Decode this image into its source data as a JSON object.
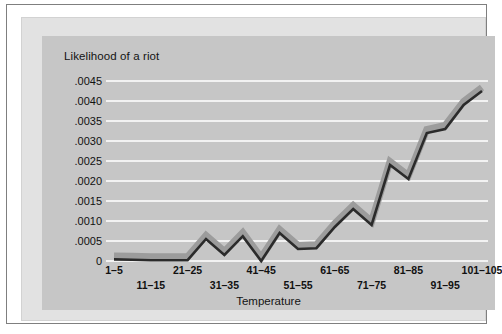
{
  "figure": {
    "background_color": "#ffffff",
    "frame_color": "#7f7f7f",
    "plot_background_color": "#c6c6c6",
    "gridline_color": "#f2f2f2",
    "series_line_color": "#2b2b2b",
    "series_shadow_color": "#9c9c9c"
  },
  "chart_data": {
    "type": "line",
    "title": "Likelihood of a riot",
    "xlabel": "Temperature",
    "ylabel": "Likelihood of a riot",
    "grid": true,
    "legend": "none",
    "xlim": [
      0,
      20
    ],
    "ylim": [
      0,
      0.0045
    ],
    "ytick_labels": [
      ".0045",
      ".0040",
      ".0035",
      ".0030",
      ".0025",
      ".0020",
      ".0015",
      ".0010",
      ".0005",
      "0"
    ],
    "ytick_values": [
      0.0045,
      0.004,
      0.0035,
      0.003,
      0.0025,
      0.002,
      0.0015,
      0.001,
      0.0005,
      0
    ],
    "xtick_labels": [
      "1–5",
      "11–15",
      "21–25",
      "31–35",
      "41–45",
      "51–55",
      "61–65",
      "71–75",
      "81–85",
      "91–95",
      "101–105"
    ],
    "xtick_indices": [
      0,
      2,
      4,
      6,
      8,
      10,
      12,
      14,
      16,
      18,
      20
    ],
    "categories": [
      "1–5",
      "6–10",
      "11–15",
      "16–20",
      "21–25",
      "26–30",
      "31–35",
      "36–40",
      "41–45",
      "46–50",
      "51–55",
      "56–60",
      "61–65",
      "66–70",
      "71–75",
      "76–80",
      "81–85",
      "86–90",
      "91–95",
      "96–100",
      "101–105"
    ],
    "values": [
      4e-05,
      3e-05,
      2e-05,
      2e-05,
      2e-05,
      0.00055,
      0.00015,
      0.00062,
      0.0,
      0.0007,
      0.0003,
      0.00032,
      0.00085,
      0.0013,
      0.0009,
      0.0024,
      0.00205,
      0.0032,
      0.0033,
      0.0039,
      0.00425
    ]
  }
}
